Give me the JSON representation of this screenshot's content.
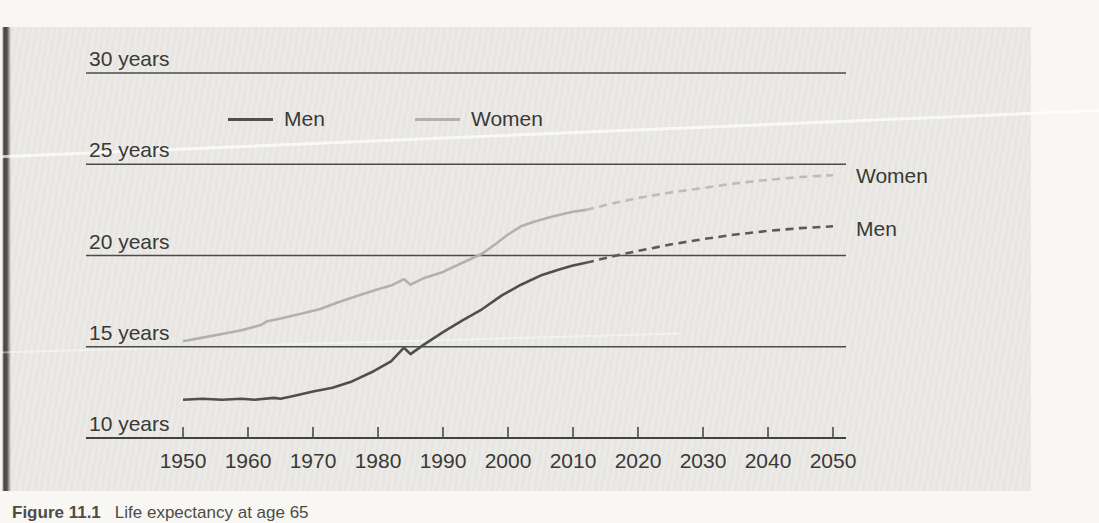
{
  "figure": {
    "caption_label": "Figure 11.1",
    "caption_text": "Life expectancy at age 65"
  },
  "colors": {
    "men": "#504f4a",
    "men_projected": "#5b5a54",
    "women": "#b2b1ab",
    "women_projected": "#bdbcb6",
    "grid": "#4b4b47",
    "axis": "#42423e",
    "text": "#393936",
    "panel_background": "#eae9e5"
  },
  "chart_data": {
    "type": "line",
    "title": "",
    "xlabel": "",
    "ylabel": "years",
    "grid": "horizontal-lines-on",
    "legend": {
      "position": "top-center",
      "items": [
        {
          "label": "Men",
          "color_key": "men"
        },
        {
          "label": "Women",
          "color_key": "women"
        }
      ]
    },
    "end_labels": {
      "women": "Women",
      "men": "Men"
    },
    "y_axis": {
      "unit": "years",
      "min": 10,
      "max": 30,
      "ticks": [
        {
          "value": 30,
          "label": "30 years"
        },
        {
          "value": 25,
          "label": "25 years"
        },
        {
          "value": 20,
          "label": "20 years"
        },
        {
          "value": 15,
          "label": "15 years"
        },
        {
          "value": 10,
          "label": "10 years",
          "axis": true
        }
      ]
    },
    "x_axis": {
      "min": 1950,
      "max": 2050,
      "ticks": [
        1950,
        1960,
        1970,
        1980,
        1990,
        2000,
        2010,
        2020,
        2030,
        2040,
        2050
      ]
    },
    "series": [
      {
        "name": "Women",
        "style": "solid",
        "color_key": "women",
        "points": [
          [
            1950,
            15.3
          ],
          [
            1953,
            15.5
          ],
          [
            1956,
            15.7
          ],
          [
            1959,
            15.9
          ],
          [
            1962,
            16.2
          ],
          [
            1963,
            16.4
          ],
          [
            1965,
            16.55
          ],
          [
            1968,
            16.8
          ],
          [
            1971,
            17.05
          ],
          [
            1974,
            17.45
          ],
          [
            1977,
            17.8
          ],
          [
            1980,
            18.15
          ],
          [
            1982,
            18.35
          ],
          [
            1984,
            18.7
          ],
          [
            1985,
            18.4
          ],
          [
            1987,
            18.75
          ],
          [
            1990,
            19.1
          ],
          [
            1993,
            19.6
          ],
          [
            1996,
            20.1
          ],
          [
            1998,
            20.6
          ],
          [
            2000,
            21.15
          ],
          [
            2002,
            21.6
          ],
          [
            2004,
            21.85
          ],
          [
            2007,
            22.15
          ],
          [
            2010,
            22.4
          ],
          [
            2012,
            22.5
          ]
        ]
      },
      {
        "name": "Women projected",
        "style": "dashed",
        "color_key": "women_projected",
        "points": [
          [
            2012,
            22.5
          ],
          [
            2016,
            22.85
          ],
          [
            2020,
            23.15
          ],
          [
            2025,
            23.45
          ],
          [
            2030,
            23.7
          ],
          [
            2035,
            23.95
          ],
          [
            2040,
            24.15
          ],
          [
            2045,
            24.3
          ],
          [
            2050,
            24.4
          ]
        ]
      },
      {
        "name": "Men",
        "style": "solid",
        "color_key": "men",
        "points": [
          [
            1950,
            12.1
          ],
          [
            1953,
            12.15
          ],
          [
            1956,
            12.1
          ],
          [
            1959,
            12.15
          ],
          [
            1961,
            12.1
          ],
          [
            1964,
            12.2
          ],
          [
            1965,
            12.15
          ],
          [
            1967,
            12.3
          ],
          [
            1970,
            12.55
          ],
          [
            1973,
            12.75
          ],
          [
            1976,
            13.1
          ],
          [
            1979,
            13.6
          ],
          [
            1982,
            14.2
          ],
          [
            1984,
            14.95
          ],
          [
            1985,
            14.6
          ],
          [
            1987,
            15.1
          ],
          [
            1990,
            15.8
          ],
          [
            1993,
            16.45
          ],
          [
            1996,
            17.05
          ],
          [
            1999,
            17.8
          ],
          [
            2002,
            18.4
          ],
          [
            2005,
            18.9
          ],
          [
            2008,
            19.25
          ],
          [
            2010,
            19.45
          ],
          [
            2012,
            19.6
          ]
        ]
      },
      {
        "name": "Men projected",
        "style": "dashed",
        "color_key": "men_projected",
        "points": [
          [
            2012,
            19.6
          ],
          [
            2016,
            19.95
          ],
          [
            2020,
            20.25
          ],
          [
            2025,
            20.6
          ],
          [
            2030,
            20.9
          ],
          [
            2035,
            21.15
          ],
          [
            2040,
            21.35
          ],
          [
            2045,
            21.5
          ],
          [
            2050,
            21.6
          ]
        ]
      }
    ]
  }
}
